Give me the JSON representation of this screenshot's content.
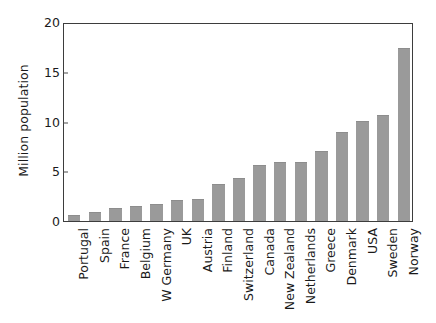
{
  "chart_data": {
    "type": "bar",
    "title": "",
    "xlabel": "",
    "ylabel": "Million population",
    "ylim": [
      0,
      20
    ],
    "yticks": [
      0,
      5,
      10,
      15,
      20
    ],
    "ytick_labels": [
      "0",
      "5",
      "10",
      "15",
      "20"
    ],
    "grid": false,
    "legend": null,
    "bar_color": "#9a9a9a",
    "axis_color": "#3d3d3d",
    "background": "#ffffff",
    "categories": [
      "Portugal",
      "Spain",
      "France",
      "Belgium",
      "W Germany",
      "UK",
      "Austria",
      "Finland",
      "Switzerland",
      "Canada",
      "New Zealand",
      "Netherlands",
      "Greece",
      "Denmark",
      "USA",
      "Sweden",
      "Norway"
    ],
    "values": [
      0.6,
      0.9,
      1.3,
      1.5,
      1.7,
      2.1,
      2.2,
      3.7,
      4.3,
      5.6,
      5.9,
      5.9,
      7.0,
      8.9,
      10.1,
      10.7,
      17.4
    ]
  }
}
